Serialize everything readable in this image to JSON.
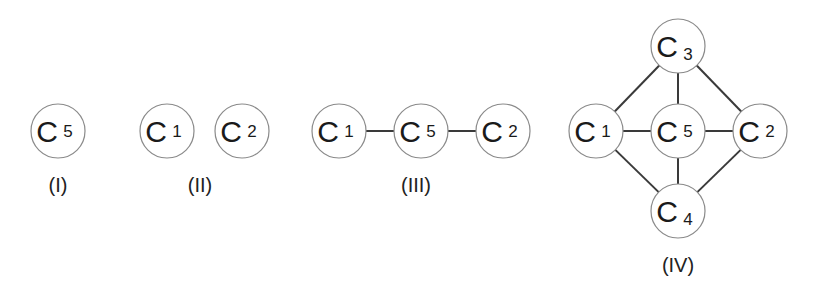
{
  "diagram": {
    "style": {
      "stroke": "#8a8a8a",
      "edge": "#3a3a3a",
      "text": "#1a1a1a"
    },
    "panels": [
      {
        "id": "I",
        "caption": "(I)",
        "caption_pos": [
          58,
          192
        ],
        "nodes": [
          {
            "id": "c5",
            "letter": "C",
            "index": "5",
            "x": 58,
            "y": 131
          }
        ],
        "edges": []
      },
      {
        "id": "II",
        "caption": "(II)",
        "caption_pos": [
          200,
          192
        ],
        "nodes": [
          {
            "id": "c1",
            "letter": "C",
            "index": "1",
            "x": 167,
            "y": 131
          },
          {
            "id": "c2",
            "letter": "C",
            "index": "2",
            "x": 242,
            "y": 131
          }
        ],
        "edges": []
      },
      {
        "id": "III",
        "caption": "(III)",
        "caption_pos": [
          416,
          192
        ],
        "nodes": [
          {
            "id": "c1",
            "letter": "C",
            "index": "1",
            "x": 339,
            "y": 131
          },
          {
            "id": "c5",
            "letter": "C",
            "index": "5",
            "x": 421,
            "y": 131
          },
          {
            "id": "c2",
            "letter": "C",
            "index": "2",
            "x": 503,
            "y": 131
          }
        ],
        "edges": [
          [
            "c1",
            "c5"
          ],
          [
            "c5",
            "c2"
          ]
        ]
      },
      {
        "id": "IV",
        "caption": "(IV)",
        "caption_pos": [
          678,
          272
        ],
        "nodes": [
          {
            "id": "c3",
            "letter": "C",
            "index": "3",
            "x": 678,
            "y": 46
          },
          {
            "id": "c1",
            "letter": "C",
            "index": "1",
            "x": 596,
            "y": 131
          },
          {
            "id": "c5",
            "letter": "C",
            "index": "5",
            "x": 678,
            "y": 131
          },
          {
            "id": "c2",
            "letter": "C",
            "index": "2",
            "x": 760,
            "y": 131
          },
          {
            "id": "c4",
            "letter": "C",
            "index": "4",
            "x": 678,
            "y": 211
          }
        ],
        "edges": [
          [
            "c3",
            "c1"
          ],
          [
            "c3",
            "c5"
          ],
          [
            "c3",
            "c2"
          ],
          [
            "c1",
            "c5"
          ],
          [
            "c5",
            "c2"
          ],
          [
            "c1",
            "c4"
          ],
          [
            "c5",
            "c4"
          ],
          [
            "c2",
            "c4"
          ]
        ]
      }
    ],
    "node_radius": 27
  }
}
